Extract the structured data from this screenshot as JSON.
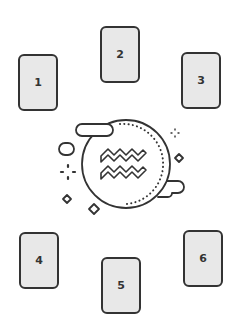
{
  "colors": {
    "stroke": "#333333",
    "card_fill": "#e8e8e8",
    "background": "#ffffff"
  },
  "cards": [
    {
      "label": "1",
      "x": 18,
      "y": 54
    },
    {
      "label": "2",
      "x": 100,
      "y": 26
    },
    {
      "label": "3",
      "x": 181,
      "y": 52
    },
    {
      "label": "4",
      "x": 19,
      "y": 232
    },
    {
      "label": "5",
      "x": 101,
      "y": 257
    },
    {
      "label": "6",
      "x": 183,
      "y": 230
    }
  ],
  "center_icon": {
    "name": "aquarius-moon-icon",
    "symbol": "aquarius"
  }
}
